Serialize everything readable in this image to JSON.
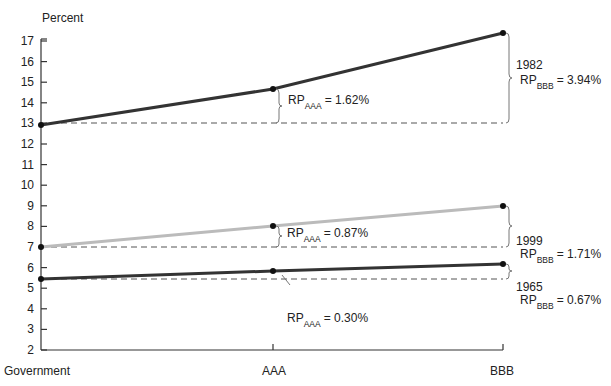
{
  "chart_data": {
    "type": "line",
    "title": "",
    "ylabel": "Percent",
    "xlabel": "",
    "categories": [
      "Government",
      "AAA",
      "BBB"
    ],
    "ylim": [
      2,
      17
    ],
    "yticks": [
      2,
      3,
      4,
      5,
      6,
      7,
      8,
      9,
      10,
      11,
      12,
      13,
      14,
      15,
      16,
      17
    ],
    "grid": false,
    "series": [
      {
        "name": "1982",
        "values": [
          12.9,
          14.52,
          16.84
        ],
        "color": "#333333"
      },
      {
        "name": "1999",
        "values": [
          5.6,
          6.47,
          7.31
        ],
        "color": "#bbbbbb"
      },
      {
        "name": "1965",
        "values": [
          4.05,
          4.35,
          4.72
        ],
        "color": "#333333"
      }
    ],
    "annotations": [
      {
        "series": "1982",
        "at": "AAA",
        "label": "RP",
        "sub": "AAA",
        "value": "= 1.62%"
      },
      {
        "series": "1982",
        "at": "BBB",
        "year": "1982",
        "label": "RP",
        "sub": "BBB",
        "value": "= 3.94%"
      },
      {
        "series": "1999",
        "at": "AAA",
        "label": "RP",
        "sub": "AAA",
        "value": "= 0.87%"
      },
      {
        "series": "1999",
        "at": "BBB",
        "year": "1999",
        "label": "RP",
        "sub": "BBB",
        "value": "= 1.71%"
      },
      {
        "series": "1965",
        "at": "AAA",
        "label": "RP",
        "sub": "AAA",
        "value": "= 0.30%"
      },
      {
        "series": "1965",
        "at": "BBB",
        "year": "1965",
        "label": "RP",
        "sub": "BBB",
        "value": "= 0.67%"
      }
    ]
  }
}
